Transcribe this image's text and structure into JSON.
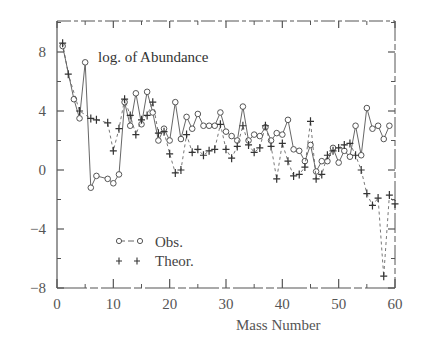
{
  "chart_data": {
    "type": "line",
    "title": "log. of Abundance",
    "xlabel": "Mass Number",
    "ylabel": "",
    "xlim": [
      0,
      60
    ],
    "ylim": [
      -8,
      10.5
    ],
    "xticks": [
      0,
      10,
      20,
      30,
      40,
      50,
      60
    ],
    "yticks": [
      8,
      4,
      0,
      -4,
      -8
    ],
    "xtick_labels": [
      "0",
      "10",
      "20",
      "30",
      "40",
      "50",
      "60"
    ],
    "ytick_labels": [
      "8",
      "4",
      "0",
      "−4",
      "−8"
    ],
    "grid": false,
    "legend_position": "lower-left",
    "series": [
      {
        "name": "Obs.",
        "marker": "circle",
        "line": "solid-dashed",
        "points": [
          [
            1,
            8.4
          ],
          [
            3,
            4.8
          ],
          [
            4,
            3.5
          ],
          [
            5,
            7.3
          ],
          [
            6,
            -1.2
          ],
          [
            7,
            -0.4
          ],
          [
            9,
            -0.6
          ],
          [
            10,
            -0.9
          ],
          [
            11,
            -0.3
          ],
          [
            12,
            4.6
          ],
          [
            13,
            3.0
          ],
          [
            14,
            5.2
          ],
          [
            15,
            3.1
          ],
          [
            16,
            5.3
          ],
          [
            17,
            3.9
          ],
          [
            18,
            2.0
          ],
          [
            19,
            2.8
          ],
          [
            20,
            2.0
          ],
          [
            21,
            4.6
          ],
          [
            22,
            2.1
          ],
          [
            23,
            3.6
          ],
          [
            24,
            2.8
          ],
          [
            25,
            3.8
          ],
          [
            26,
            3.0
          ],
          [
            27,
            3.0
          ],
          [
            28,
            3.0
          ],
          [
            29,
            3.9
          ],
          [
            30,
            2.6
          ],
          [
            31,
            2.3
          ],
          [
            32,
            2.0
          ],
          [
            33,
            4.3
          ],
          [
            34,
            2.0
          ],
          [
            35,
            2.4
          ],
          [
            36,
            2.3
          ],
          [
            37,
            2.9
          ],
          [
            38,
            2.0
          ],
          [
            39,
            2.5
          ],
          [
            40,
            2.4
          ],
          [
            41,
            3.4
          ],
          [
            42,
            1.4
          ],
          [
            43,
            1.3
          ],
          [
            44,
            0.6
          ],
          [
            45,
            1.7
          ],
          [
            46,
            -0.1
          ],
          [
            47,
            0.6
          ],
          [
            48,
            0.6
          ],
          [
            49,
            1.5
          ],
          [
            50,
            0.5
          ],
          [
            51,
            1.3
          ],
          [
            52,
            0.9
          ],
          [
            53,
            3.0
          ],
          [
            54,
            1.0
          ],
          [
            55,
            4.2
          ],
          [
            56,
            2.8
          ],
          [
            57,
            3.0
          ],
          [
            58,
            2.1
          ],
          [
            59,
            3.0
          ]
        ]
      },
      {
        "name": "Theor.",
        "marker": "plus",
        "line": "dashed",
        "points": [
          [
            1,
            8.6
          ],
          [
            2,
            6.5
          ],
          [
            4,
            4.0
          ],
          [
            6,
            3.5
          ],
          [
            7,
            3.4
          ],
          [
            9,
            3.2
          ],
          [
            10,
            1.3
          ],
          [
            11,
            2.8
          ],
          [
            12,
            4.8
          ],
          [
            13,
            3.7
          ],
          [
            14,
            2.4
          ],
          [
            15,
            3.4
          ],
          [
            16,
            3.7
          ],
          [
            17,
            4.6
          ],
          [
            18,
            2.5
          ],
          [
            19,
            2.6
          ],
          [
            20,
            1.1
          ],
          [
            21,
            -0.2
          ],
          [
            22,
            0.0
          ],
          [
            23,
            2.4
          ],
          [
            24,
            1.2
          ],
          [
            25,
            1.4
          ],
          [
            26,
            1.0
          ],
          [
            27,
            1.3
          ],
          [
            28,
            1.4
          ],
          [
            29,
            3.1
          ],
          [
            30,
            1.4
          ],
          [
            31,
            0.8
          ],
          [
            32,
            1.6
          ],
          [
            33,
            3.0
          ],
          [
            34,
            1.7
          ],
          [
            35,
            1.2
          ],
          [
            36,
            1.5
          ],
          [
            37,
            3.0
          ],
          [
            38,
            1.6
          ],
          [
            39,
            -0.6
          ],
          [
            40,
            1.8
          ],
          [
            41,
            0.6
          ],
          [
            42,
            -0.4
          ],
          [
            43,
            -0.3
          ],
          [
            44,
            0.2
          ],
          [
            45,
            3.3
          ],
          [
            46,
            -0.6
          ],
          [
            47,
            -0.3
          ],
          [
            48,
            1.0
          ],
          [
            49,
            1.3
          ],
          [
            50,
            1.5
          ],
          [
            51,
            1.7
          ],
          [
            52,
            1.8
          ],
          [
            53,
            1.0
          ],
          [
            54,
            0.0
          ],
          [
            55,
            -1.6
          ],
          [
            56,
            -2.4
          ],
          [
            57,
            -1.9
          ],
          [
            58,
            -7.2
          ],
          [
            59,
            -1.7
          ],
          [
            60,
            -2.3
          ]
        ]
      }
    ]
  },
  "legend": {
    "items": [
      {
        "label": "Obs.",
        "symbol": "o--o"
      },
      {
        "label": "Theor.",
        "symbol": "+ +"
      }
    ]
  },
  "colors": {
    "ink": "#555555",
    "background": "#ffffff"
  }
}
